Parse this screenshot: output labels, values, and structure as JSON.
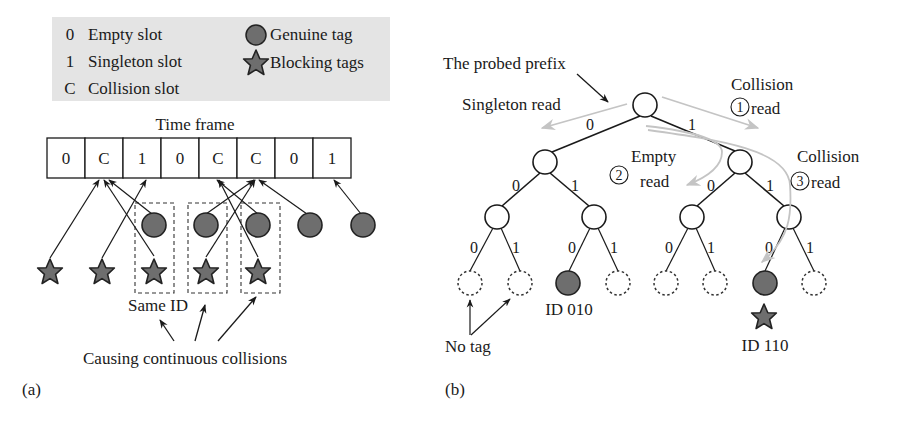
{
  "panel_a": {
    "label": "(a)",
    "legend": {
      "background": "#e4e4e4",
      "items": [
        {
          "symbol": "0",
          "text": "Empty slot"
        },
        {
          "symbol": "1",
          "text": "Singleton slot"
        },
        {
          "symbol": "C",
          "text": "Collision slot"
        }
      ],
      "tag_items": [
        {
          "icon": "circle",
          "text": "Genuine tag"
        },
        {
          "icon": "star",
          "text": "Blocking tags"
        }
      ]
    },
    "time_frame": {
      "title": "Time frame",
      "slots": [
        "0",
        "C",
        "1",
        "0",
        "C",
        "C",
        "0",
        "1"
      ]
    },
    "same_id_label": "Same ID",
    "caption": "Causing continuous collisions"
  },
  "panel_b": {
    "label": "(b)",
    "probed_prefix_label": "The probed prefix",
    "singleton_read_label": "Singleton read",
    "collision_read_1": {
      "number": "1",
      "line1": "Collision",
      "line2": "read"
    },
    "empty_read_2": {
      "number": "2",
      "line1": "Empty",
      "line2": "read"
    },
    "collision_read_3": {
      "number": "3",
      "line1": "Collision",
      "line2": "read"
    },
    "edge_labels": {
      "zero": "0",
      "one": "1"
    },
    "id_010_label": "ID 010",
    "id_110_label": "ID 110",
    "no_tag_label": "No tag"
  },
  "colors": {
    "tag_fill": "#6e6e6e",
    "tag_stroke": "#222222",
    "read_arrow": "#bdbdbd",
    "legend_bg": "#e4e4e4"
  }
}
